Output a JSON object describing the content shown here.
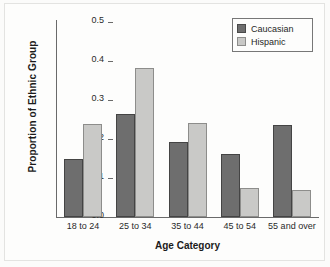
{
  "chart_data": {
    "type": "bar",
    "title": "",
    "xlabel": "Age Category",
    "ylabel": "Proportion of Ethnic Group",
    "categories": [
      "18 to 24",
      "25 to 34",
      "35 to 44",
      "45 to 54",
      "55 and over"
    ],
    "series": [
      {
        "name": "Caucasian",
        "color": "#6e6e6e",
        "values": [
          0.15,
          0.265,
          0.193,
          0.162,
          0.237
        ]
      },
      {
        "name": "Hispanic",
        "color": "#c9c9c7",
        "values": [
          0.238,
          0.382,
          0.241,
          0.075,
          0.068
        ]
      }
    ],
    "ylim": [
      0.0,
      0.5
    ],
    "yticks": [
      "0.0",
      "0.1",
      "0.2",
      "0.3",
      "0.4",
      "0.5"
    ],
    "ytick_values": [
      0.0,
      0.1,
      0.2,
      0.3,
      0.4,
      0.5
    ],
    "grid": false,
    "legend_position": "top-right"
  },
  "legend": {
    "entries": [
      {
        "label": "Caucasian"
      },
      {
        "label": "Hispanic"
      }
    ]
  }
}
